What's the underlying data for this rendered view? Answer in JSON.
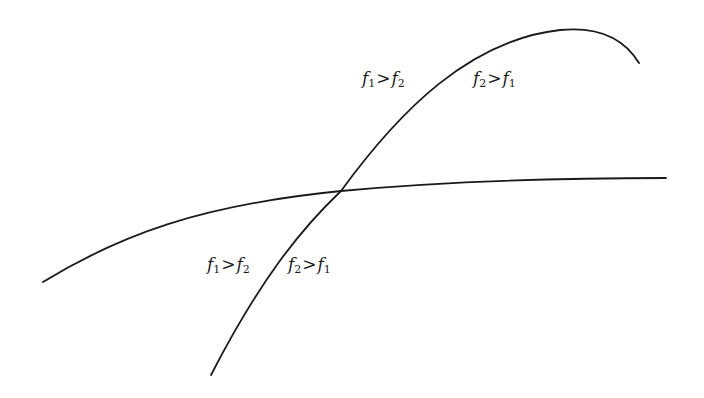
{
  "diagram": {
    "background": "#ffffff",
    "stroke_color": "#1a1a1a",
    "curves": [
      {
        "id": "steep-curve",
        "description": "Steeply rising concave curve with a maximum near the top right",
        "path": "M 211 375 C 260 280, 300 230, 341 191 C 400 110, 470 40, 560 30 C 600 26, 625 40, 639 63"
      },
      {
        "id": "flat-curve",
        "description": "Gently rising concave curve leveling off to the right",
        "path": "M 43 282 C 120 235, 200 205, 341 191 C 450 181, 560 178, 666 178"
      }
    ],
    "intersection": {
      "x": 341,
      "y": 191
    },
    "labels": [
      {
        "id": "upper-left",
        "lhs": "f",
        "lhs_sub": "1",
        "op": ">",
        "rhs": "f",
        "rhs_sub": "2",
        "x": 362,
        "y": 70
      },
      {
        "id": "upper-right",
        "lhs": "f",
        "lhs_sub": "2",
        "op": ">",
        "rhs": "f",
        "rhs_sub": "1",
        "x": 473,
        "y": 70
      },
      {
        "id": "lower-left",
        "lhs": "f",
        "lhs_sub": "1",
        "op": ">",
        "rhs": "f",
        "rhs_sub": "2",
        "x": 207,
        "y": 256
      },
      {
        "id": "lower-right",
        "lhs": "f",
        "lhs_sub": "2",
        "op": ">",
        "rhs": "f",
        "rhs_sub": "1",
        "x": 288,
        "y": 256
      }
    ]
  }
}
